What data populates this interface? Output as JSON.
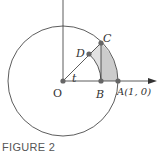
{
  "figure": {
    "caption": "FIGURE 2",
    "labels": {
      "origin": "O",
      "point_a": "A(1, 0)",
      "point_b": "B",
      "point_c": "C",
      "point_d": "D",
      "angle": "t"
    },
    "colors": {
      "stroke": "#333333",
      "shade": "#cccccc",
      "point": "#666666"
    }
  }
}
